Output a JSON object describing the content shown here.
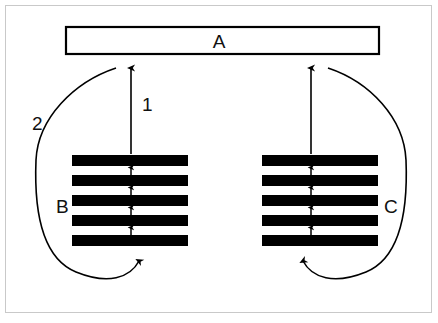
{
  "figure": {
    "width": 438,
    "height": 323,
    "background_color": "#ffffff",
    "frame_color": "#c9c9c9",
    "ink_color": "#000000"
  },
  "labels": {
    "box_top": "A",
    "stack_left": "B",
    "stack_right": "C",
    "arrow_straight": "1",
    "arrow_curved": "2"
  },
  "box_a": {
    "label": "A",
    "x": 65,
    "y": 26,
    "width": 315,
    "height": 29,
    "fill": "#ffffff",
    "stroke": "#000000",
    "stroke_width": 2
  },
  "stacks": [
    {
      "name": "stack-b",
      "label": "B",
      "label_side": "left",
      "x": 72,
      "width": 116,
      "bar_count": 5,
      "bar_height": 11,
      "bar_pitch": 20,
      "first_bar_y": 155,
      "fill": "#000000"
    },
    {
      "name": "stack-c",
      "label": "C",
      "label_side": "right",
      "x": 262,
      "width": 116,
      "bar_count": 5,
      "bar_height": 11,
      "bar_pitch": 20,
      "first_bar_y": 155,
      "fill": "#000000"
    }
  ],
  "inner_arrows": {
    "description": "small upward arrows spanning the gaps between adjacent bars in each stack",
    "count_per_stack": 4,
    "direction": "up",
    "stroke": "#000000"
  },
  "straight_arrows": [
    {
      "name": "arrow-1-left",
      "label": "1",
      "from": "stack-b",
      "to": "box-a",
      "x": 131,
      "y_start": 155,
      "y_end": 65,
      "direction": "up"
    },
    {
      "name": "arrow-1-right",
      "label": "",
      "from": "stack-c",
      "to": "box-a",
      "x": 311,
      "y_start": 155,
      "y_end": 65,
      "direction": "up"
    }
  ],
  "curved_arrows": [
    {
      "name": "arrow-2-left",
      "label": "2",
      "side": "left",
      "from": "near box-a / top of arrow 1",
      "to": "bottom of stack-b",
      "direction": "counterclockwise-loop-up-into-stack"
    },
    {
      "name": "arrow-2-right",
      "label": "",
      "side": "right",
      "from": "near box-a / top of right arrow",
      "to": "bottom of stack-c",
      "direction": "clockwise-loop-up-into-stack"
    }
  ]
}
